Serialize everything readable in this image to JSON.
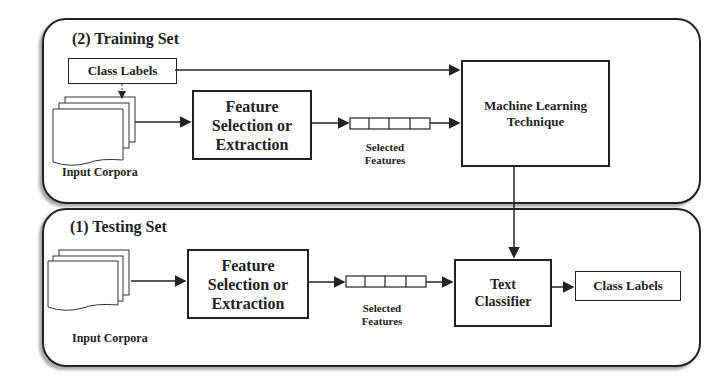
{
  "training": {
    "title": "(2)  Training Set",
    "class_labels": "Class Labels",
    "input_corpora": "Input Corpora",
    "feature_box": "Feature Selection or Extraction",
    "selected_features": [
      "Selected",
      "Features"
    ],
    "ml_box": [
      "Machine Learning",
      "Technique"
    ]
  },
  "testing": {
    "title": "(1)  Testing Set",
    "input_corpora": "Input Corpora",
    "feature_box": "Feature Selection or Extraction",
    "selected_features": [
      "Selected",
      "Features"
    ],
    "classifier_box": [
      "Text",
      "Classifier"
    ],
    "class_labels": "Class Labels"
  }
}
